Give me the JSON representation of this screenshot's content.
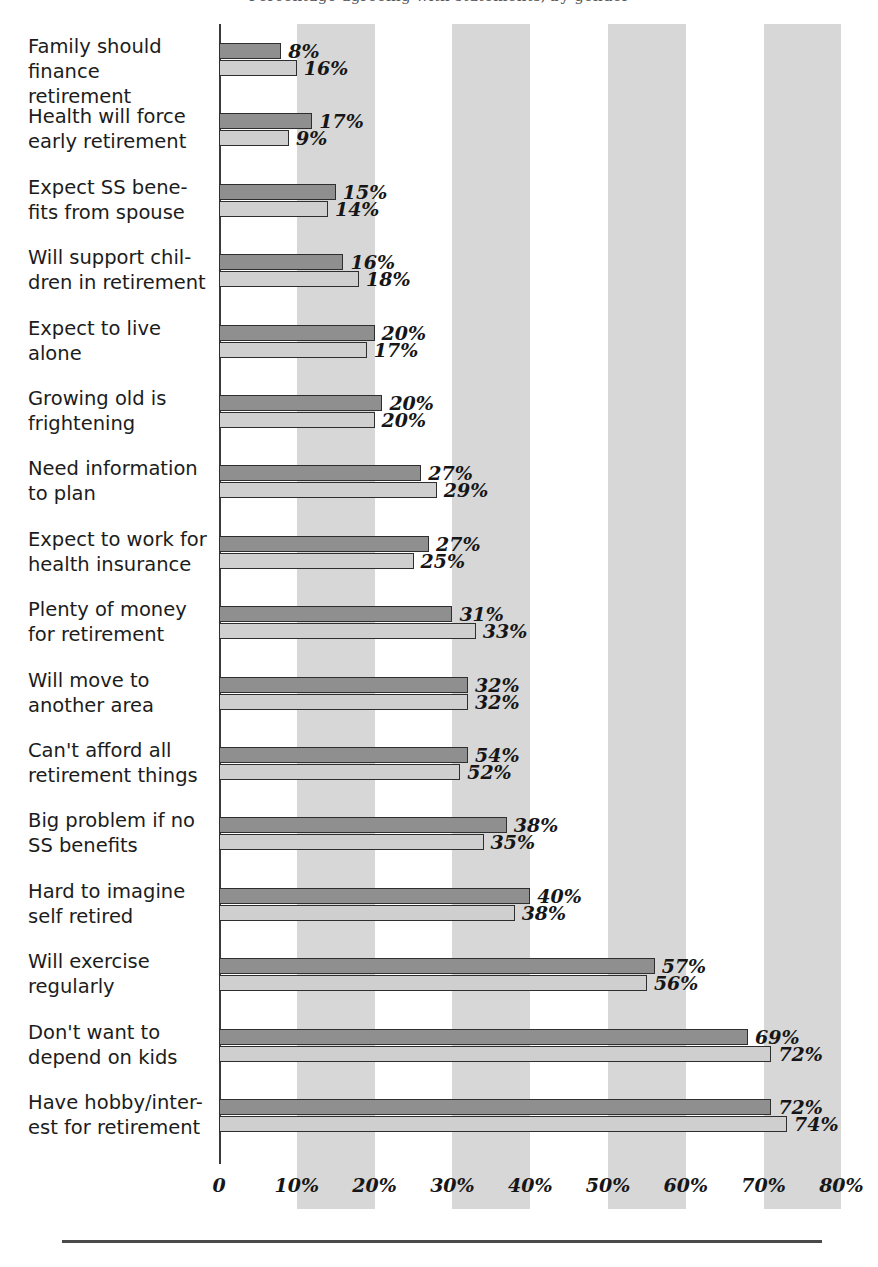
{
  "figure": {
    "title_cropped": "Percentage agreeing with statements, by gender",
    "bottom_rule": "horizontal-rule"
  },
  "axis": {
    "ticks": [
      "0",
      "10%",
      "20%",
      "30%",
      "40%",
      "50%",
      "60%",
      "70%",
      "80%"
    ],
    "tick_values": [
      0,
      10,
      20,
      30,
      40,
      50,
      60,
      70,
      80
    ],
    "xmin": 0,
    "xmax": 80,
    "bands": [
      [
        10,
        20
      ],
      [
        30,
        40
      ],
      [
        50,
        60
      ],
      [
        70,
        80
      ]
    ]
  },
  "colors": {
    "series_1": "#8f8f8f",
    "series_2": "#cfcfcf",
    "band": "#c9c9c9",
    "axis": "#3a3a3a",
    "text": "#161616"
  },
  "chart_data": {
    "type": "bar",
    "orientation": "horizontal",
    "title": "Percentage agreeing with statements, by gender",
    "xlabel": "",
    "ylabel": "",
    "xlim": [
      0,
      80
    ],
    "grid": "vertical shaded bands at 10-20%, 30-40%, 50-60%, 70-80%",
    "legend": "none shown",
    "value_label_suffix": "%",
    "categories": [
      "Family should\nfinance retirement",
      "Health will force\nearly retirement",
      "Expect SS bene-\nfits from spouse",
      "Will support chil-\ndren in retirement",
      "Expect to live\nalone",
      "Growing old is\nfrightening",
      "Need information\nto plan",
      "Expect to work for\nhealth insurance",
      "Plenty of money\nfor retirement",
      "Will move to\nanother area",
      "Can't afford all\nretirement things",
      "Big problem if no\nSS benefits",
      "Hard to imagine\nself retired",
      "Will exercise\nregularly",
      "Don't want to\ndepend on kids",
      "Have hobby/inter-\nest for retirement"
    ],
    "series": [
      {
        "name": "series-1-dark",
        "values": [
          8,
          17,
          15,
          16,
          20,
          20,
          27,
          27,
          31,
          32,
          54,
          38,
          40,
          57,
          69,
          72
        ],
        "labels": [
          "8%",
          "17%",
          "15%",
          "16%",
          "20%",
          "20%",
          "27%",
          "27%",
          "31%",
          "32%",
          "54%",
          "38%",
          "40%",
          "57%",
          "69%",
          "72%"
        ],
        "drawn_lengths": [
          8,
          12,
          15,
          16,
          20,
          21,
          26,
          27,
          30,
          32,
          32,
          37,
          40,
          56,
          68,
          71
        ]
      },
      {
        "name": "series-2-light",
        "values": [
          16,
          9,
          14,
          18,
          17,
          20,
          29,
          25,
          33,
          32,
          52,
          35,
          38,
          56,
          72,
          74
        ],
        "labels": [
          "16%",
          "9%",
          "14%",
          "18%",
          "17%",
          "20%",
          "29%",
          "25%",
          "33%",
          "32%",
          "52%",
          "35%",
          "38%",
          "56%",
          "72%",
          "74%"
        ],
        "drawn_lengths": [
          10,
          9,
          14,
          18,
          19,
          20,
          28,
          25,
          33,
          32,
          31,
          34,
          38,
          55,
          71,
          73
        ]
      }
    ]
  }
}
